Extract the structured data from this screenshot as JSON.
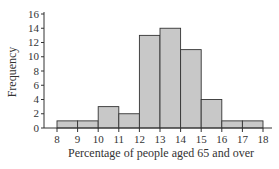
{
  "chart_data": {
    "type": "bar",
    "subtype": "histogram",
    "title": "",
    "xlabel": "Percentage of people aged 65 and over",
    "ylabel": "Frequency",
    "bin_edges": [
      8,
      9,
      10,
      11,
      12,
      13,
      14,
      15,
      16,
      17,
      18
    ],
    "categories": [
      "8-9",
      "9-10",
      "10-11",
      "11-12",
      "12-13",
      "13-14",
      "14-15",
      "15-16",
      "16-17",
      "17-18"
    ],
    "values": [
      1,
      1,
      3,
      2,
      13,
      14,
      11,
      4,
      1,
      1
    ],
    "xlim": [
      8,
      18
    ],
    "ylim": [
      0,
      16
    ],
    "xticks": [
      "8",
      "9",
      "10",
      "11",
      "12",
      "13",
      "14",
      "15",
      "16",
      "17",
      "18"
    ],
    "yticks": [
      "0",
      "2",
      "4",
      "6",
      "8",
      "10",
      "12",
      "14",
      "16"
    ],
    "grid": false,
    "legend": null,
    "colors": {
      "bar_fill": "#c8c8c8",
      "bar_edge": "#333333",
      "axis": "#333333"
    }
  }
}
